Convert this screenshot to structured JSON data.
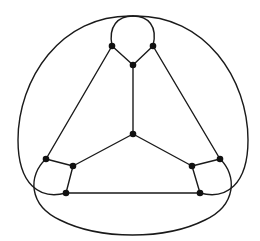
{
  "diagram": {
    "title": "",
    "type": "planar-graph",
    "stroke_color": "#1a1a1a",
    "node_color": "#111111",
    "node_radius": 3.3,
    "nodes": [
      {
        "id": "top-left",
        "x": 112,
        "y": 46
      },
      {
        "id": "top-right",
        "x": 153,
        "y": 46
      },
      {
        "id": "top-center",
        "x": 133,
        "y": 65
      },
      {
        "id": "center",
        "x": 133,
        "y": 134
      },
      {
        "id": "left-outer",
        "x": 46,
        "y": 159
      },
      {
        "id": "left-inner",
        "x": 73,
        "y": 166
      },
      {
        "id": "left-bottom",
        "x": 66,
        "y": 193
      },
      {
        "id": "right-inner",
        "x": 192,
        "y": 166
      },
      {
        "id": "right-outer",
        "x": 220,
        "y": 159
      },
      {
        "id": "right-bottom",
        "x": 200,
        "y": 193
      }
    ],
    "edges": [
      {
        "id": "e-tl-tc",
        "d": "M112 46 L133 65"
      },
      {
        "id": "e-tr-tc",
        "d": "M153 46 L133 65"
      },
      {
        "id": "e-tc-c",
        "d": "M133 65 L133 134"
      },
      {
        "id": "e-c-li",
        "d": "M133 134 L73 166"
      },
      {
        "id": "e-c-ri",
        "d": "M133 134 L192 166"
      },
      {
        "id": "e-tl-lo",
        "d": "M112 46 L46 159"
      },
      {
        "id": "e-tr-ro",
        "d": "M153 46 L220 159"
      },
      {
        "id": "e-lo-li",
        "d": "M46 159 L73 166"
      },
      {
        "id": "e-li-lb",
        "d": "M73 166 L66 193"
      },
      {
        "id": "e-ri-ro",
        "d": "M192 166 L220 159"
      },
      {
        "id": "e-ri-rb",
        "d": "M192 166 L200 193"
      },
      {
        "id": "e-lb-rb",
        "d": "M66 193 L200 193"
      },
      {
        "id": "e-tl-tr-arc",
        "d": "M112 46 C108 26 118 16 133 16 C148 16 158 26 153 46"
      },
      {
        "id": "e-tr-outer-lb",
        "d": "M133 16 C60 14 18 80 18 140 C18 185 40 200 66 193"
      },
      {
        "id": "e-tl-outer-rb",
        "d": "M133 16 C206 14 248 80 248 140 C248 185 226 200 200 193"
      },
      {
        "id": "e-lo-bottom-ro",
        "d": "M46 159 C28 175 28 205 60 220 C100 240 165 240 205 220 C237 205 237 175 220 159"
      }
    ]
  }
}
